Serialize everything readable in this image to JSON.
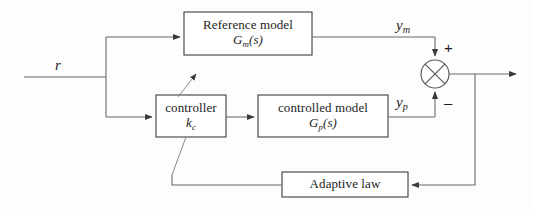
{
  "diagram": {
    "type": "block-diagram",
    "canvas": {
      "width": 533,
      "height": 213
    },
    "colors": {
      "background": "#fdfdfd",
      "block_border": "#3d3d3d",
      "wire": "#6a6a6a",
      "text": "#1c1c1c",
      "arrowhead": "#3a3a3a"
    }
  },
  "blocks": {
    "reference_model": {
      "name": "Reference model",
      "transfer_function_base": "G",
      "transfer_function_sub": "m",
      "transfer_function_arg": "(s)",
      "x": 184,
      "y": 12,
      "w": 128,
      "h": 43
    },
    "controller": {
      "name": "controller",
      "gain_base": "k",
      "gain_sub": "c",
      "x": 156,
      "y": 95,
      "w": 70,
      "h": 42
    },
    "controlled_model": {
      "name": "controlled model",
      "transfer_function_base": "G",
      "transfer_function_sub": "p",
      "transfer_function_arg": "(s)",
      "x": 258,
      "y": 95,
      "w": 130,
      "h": 42
    },
    "adaptive_law": {
      "name": "Adaptive law",
      "x": 282,
      "y": 172,
      "w": 126,
      "h": 25
    }
  },
  "signals": {
    "input": {
      "label_base": "r",
      "label_sub": ""
    },
    "model_output": {
      "label_base": "y",
      "label_sub": "m"
    },
    "plant_output": {
      "label_base": "y",
      "label_sub": "p"
    },
    "sum_plus": "+",
    "sum_minus": "–"
  },
  "summing_junction": {
    "name": "summing-junction",
    "cx": 435,
    "cy": 74,
    "r": 14,
    "plus_input": "model_output",
    "minus_input": "plant_output"
  }
}
